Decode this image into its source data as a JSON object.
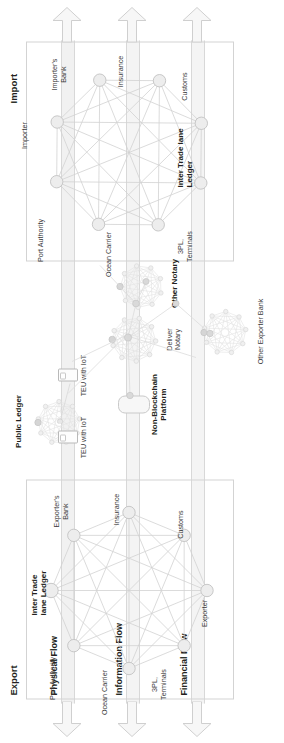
{
  "diagram": {
    "orientation_deg": -90,
    "canvas": {
      "w": 743,
      "h": 284
    }
  },
  "sections": [
    {
      "id": "export",
      "label": "Export"
    },
    {
      "id": "import",
      "label": "Import"
    }
  ],
  "flows": [
    {
      "id": "physical",
      "label": "Physical Flow"
    },
    {
      "id": "information",
      "label": "Information Flow"
    },
    {
      "id": "financial",
      "label": "Financial Flow"
    }
  ],
  "networks": {
    "export": {
      "center_label_line1": "Inter Trade",
      "center_label_line2": "lane Ledger",
      "nodes": [
        {
          "id": "3pl",
          "label": "3PL,\nTerminals"
        },
        {
          "id": "ocean",
          "label": "Ocean Carrier"
        },
        {
          "id": "port",
          "label": "Port Authority"
        },
        {
          "id": "expbank",
          "label": "Exporter's\nBank"
        },
        {
          "id": "insurance",
          "label": "Insurance"
        },
        {
          "id": "customs",
          "label": "Customs"
        },
        {
          "id": "exporter",
          "label": "Exporter"
        }
      ]
    },
    "import": {
      "center_label_line1": "Inter Trade lane",
      "center_label_line2": "Ledger",
      "nodes": [
        {
          "id": "3pl",
          "label": "3PL,\nTerminals"
        },
        {
          "id": "ocean",
          "label": "Ocean Carrier"
        },
        {
          "id": "port",
          "label": "Port Authority"
        },
        {
          "id": "importer",
          "label": "Importer"
        },
        {
          "id": "impbank",
          "label": "Importer's\nBank"
        },
        {
          "id": "insurance",
          "label": "Insurance"
        },
        {
          "id": "customs",
          "label": "Customs"
        }
      ]
    }
  },
  "middle": {
    "public_ledger": "Public Ledger",
    "teu_left": "TEU with IoT",
    "teu_right": "TEU with IoT",
    "non_blockchain_line1": "Non-Blockchain",
    "non_blockchain_line2": "Platform",
    "deliver_notary_line1": "Deliver",
    "deliver_notary_line2": "Notary",
    "other_notary": "Other Notary",
    "other_exporter_bank": "Other Exporter Bank"
  },
  "colors": {
    "text": "#231f20",
    "muted_text": "#3a3a3a",
    "band_fill": "#f1f1f1",
    "band_stroke": "#d8d8d8",
    "panel_stroke": "#d3d3d3",
    "edge_rule": "#9b9b9b",
    "node_fill": "#ededed",
    "node_stroke": "#c4c4c4",
    "link": "#cfcfcf",
    "mesh": "#dcdcdc",
    "arrow_fill": "#f7f7f7",
    "arrow_stroke": "#cccccc"
  }
}
